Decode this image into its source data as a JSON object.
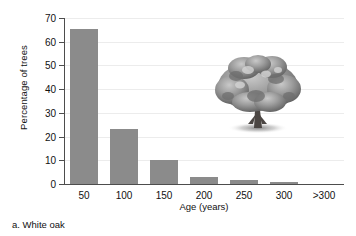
{
  "chart_data": {
    "type": "bar",
    "title": "",
    "categories": [
      "50",
      "100",
      "150",
      "200",
      "250",
      "300",
      ">300"
    ],
    "values": [
      65.5,
      23.0,
      10.0,
      3.0,
      1.5,
      1.0,
      0.0
    ],
    "xlabel": "Age (years)",
    "ylabel": "Percentage of trees",
    "ylim": [
      0,
      70
    ],
    "yticks": [
      0,
      10,
      20,
      30,
      40,
      50,
      60,
      70
    ],
    "ytick_labels": [
      "0",
      "10",
      "20",
      "30",
      "40",
      "50",
      "60",
      "70"
    ],
    "grid": true,
    "legend": "none",
    "bar_color": "#8b8b8b",
    "axis_color": "#4d4d4d",
    "grid_color": "#ececec"
  },
  "caption": "a. White oak",
  "decoration": {
    "tree_alt": "white-oak-tree-photo"
  }
}
